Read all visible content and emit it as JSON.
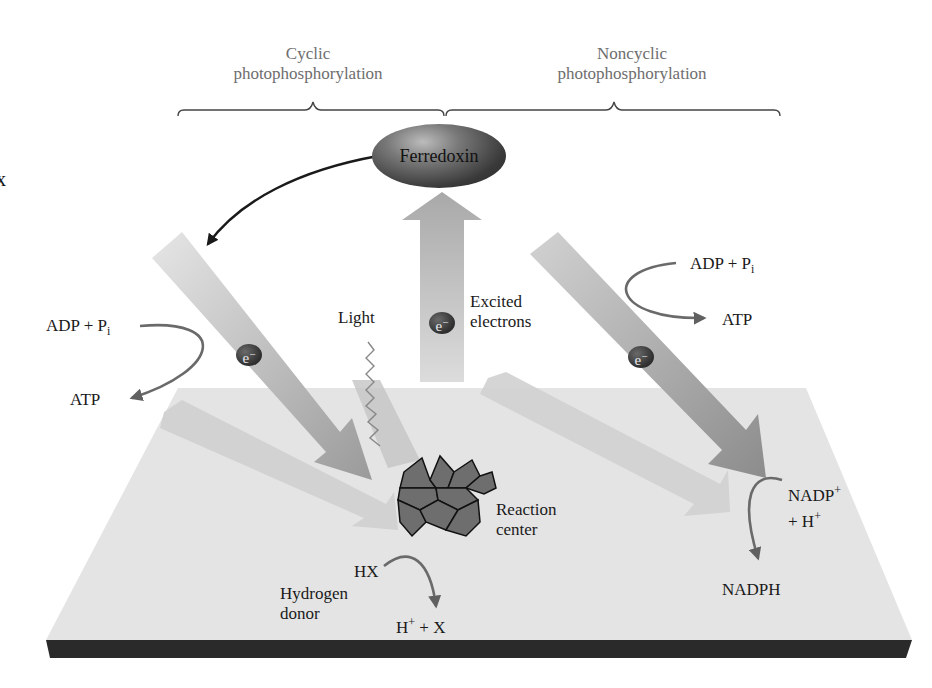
{
  "diagram": {
    "type": "photophosphorylation-schematic",
    "colors": {
      "plane": "#e4e4e4",
      "plane_base": "#2a2a2a",
      "arrow_light": "#d6d6d6",
      "arrow_mid": "#a8a8a8",
      "arrow_dark": "#8a8a8a",
      "curve_arrow": "#6a6a6a",
      "reaction_center": "#6e6e6e",
      "label_grey": "#6e6e6e"
    }
  },
  "headers": {
    "cyclic": {
      "line1": "Cyclic",
      "line2": "photophosphorylation"
    },
    "noncyclic": {
      "line1": "Noncyclic",
      "line2": "photophosphorylation"
    }
  },
  "nodes": {
    "ferredoxin": "Ferredoxin",
    "reaction_center": {
      "line1": "Reaction",
      "line2": "center"
    }
  },
  "labels": {
    "light": "Light",
    "excited_electrons": {
      "line1": "Excited",
      "line2": "electrons"
    },
    "electron": "e",
    "electron_charge": "−",
    "left_adp": "ADP + P",
    "left_adp_sub": "i",
    "left_atp": "ATP",
    "right_adp": "ADP + P",
    "right_adp_sub": "i",
    "right_atp": "ATP",
    "hx": "HX",
    "hydrogen_donor": {
      "line1": "Hydrogen",
      "line2": "donor"
    },
    "h_plus_x": {
      "h": "H",
      "sup": "+",
      "rest": " + X"
    },
    "nadp": {
      "base": "NADP",
      "sup": "+"
    },
    "plus_h": {
      "base": "+ H",
      "sup": "+"
    },
    "nadph": "NADPH",
    "edge_fragment": "x"
  }
}
